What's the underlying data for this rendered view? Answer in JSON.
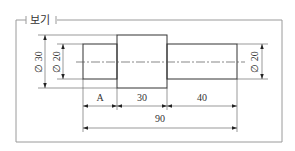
{
  "frame": {
    "label": "보기"
  },
  "shaft": {
    "sections": [
      {
        "name": "left-section",
        "diameter_label": "Ø 20",
        "length_label": "A"
      },
      {
        "name": "middle-section",
        "diameter_label": "Ø 30",
        "length_label": "30"
      },
      {
        "name": "right-section",
        "diameter_label": "Ø 20",
        "length_label": "40"
      }
    ],
    "total_length_label": "90"
  },
  "dimensions": {
    "left_outer_diameter": "∅ 30",
    "left_inner_diameter": "∅ 20",
    "right_diameter": "∅ 20",
    "segment_a": "A",
    "segment_middle": "30",
    "segment_right": "40",
    "overall": "90"
  },
  "colors": {
    "line": "#333333",
    "frame": "#9a9a9a",
    "background": "#ffffff"
  }
}
